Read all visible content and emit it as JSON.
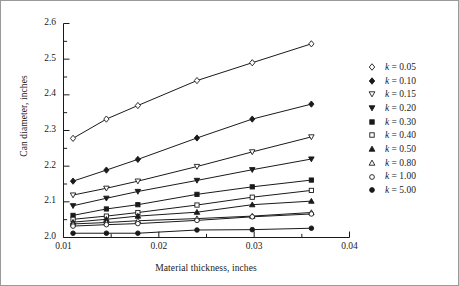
{
  "chart_data": {
    "type": "line",
    "title": "",
    "xlabel": "Material thickness, inches",
    "ylabel": "Can diameter, inches",
    "xlim": [
      0.01,
      0.04
    ],
    "ylim": [
      2.0,
      2.6
    ],
    "xticks": [
      0.01,
      0.02,
      0.03,
      0.04
    ],
    "xtick_labels": [
      "0.01",
      "0.02",
      "0.03",
      "0.04"
    ],
    "yticks": [
      2.0,
      2.1,
      2.2,
      2.3,
      2.4,
      2.5,
      2.6
    ],
    "ytick_labels": [
      "2.0",
      "2.1",
      "2.2",
      "2.3",
      "2.4",
      "2.5",
      "2.6"
    ],
    "x_minor_step": 0.005,
    "y_minor_step": 0.05,
    "grid": false,
    "legend_position": "right",
    "x": [
      0.011,
      0.0145,
      0.0178,
      0.024,
      0.0298,
      0.036
    ],
    "series": [
      {
        "name": "k = 0.05",
        "marker": "open-diamond",
        "values": [
          2.278,
          2.332,
          2.37,
          2.44,
          2.49,
          2.543
        ]
      },
      {
        "name": "k = 0.10",
        "marker": "filled-diamond",
        "values": [
          2.158,
          2.189,
          2.219,
          2.279,
          2.332,
          2.374
        ]
      },
      {
        "name": "k = 0.15",
        "marker": "open-triangle-down",
        "values": [
          2.119,
          2.138,
          2.158,
          2.199,
          2.24,
          2.282
        ]
      },
      {
        "name": "k = 0.20",
        "marker": "filled-triangle-down",
        "values": [
          2.089,
          2.11,
          2.129,
          2.16,
          2.19,
          2.22
        ]
      },
      {
        "name": "k = 0.30",
        "marker": "filled-square",
        "values": [
          2.062,
          2.08,
          2.092,
          2.121,
          2.142,
          2.161
        ]
      },
      {
        "name": "k = 0.40",
        "marker": "open-square",
        "values": [
          2.051,
          2.06,
          2.07,
          2.091,
          2.113,
          2.132
        ]
      },
      {
        "name": "k = 0.50",
        "marker": "filled-triangle-up",
        "values": [
          2.043,
          2.051,
          2.06,
          2.071,
          2.092,
          2.102
        ]
      },
      {
        "name": "k = 0.80",
        "marker": "open-triangle-up",
        "values": [
          2.038,
          2.042,
          2.047,
          2.053,
          2.06,
          2.07
        ]
      },
      {
        "name": "k = 1.00",
        "marker": "open-circle",
        "values": [
          2.032,
          2.036,
          2.039,
          2.048,
          2.058,
          2.066
        ]
      },
      {
        "name": "k = 5.00",
        "marker": "filled-circle",
        "values": [
          2.012,
          2.012,
          2.012,
          2.021,
          2.022,
          2.026
        ]
      }
    ]
  },
  "legend": {
    "items": [
      {
        "label": "k = 0.05"
      },
      {
        "label": "k = 0.10"
      },
      {
        "label": "k = 0.15"
      },
      {
        "label": "k = 0.20"
      },
      {
        "label": "k = 0.30"
      },
      {
        "label": "k = 0.40"
      },
      {
        "label": "k = 0.50"
      },
      {
        "label": "k = 0.80"
      },
      {
        "label": "k = 1.00"
      },
      {
        "label": "k = 5.00"
      }
    ]
  },
  "colors": {
    "line": "#1a1a1a",
    "axis": "#1a1a1a",
    "frame": "#9a9a9a",
    "background": "#ffffff"
  }
}
